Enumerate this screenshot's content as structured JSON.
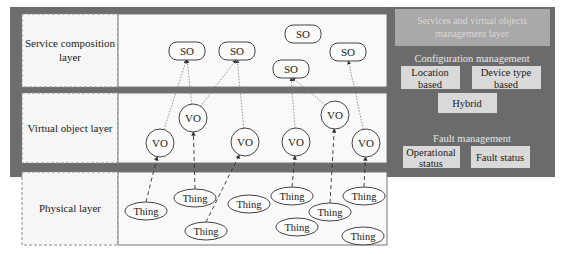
{
  "layers": [
    {
      "label_lines": [
        "Service composition",
        "layer"
      ]
    },
    {
      "label_lines": [
        "Virtual object layer"
      ]
    },
    {
      "label_lines": [
        "Physical layer"
      ]
    }
  ],
  "service_objects": [
    {
      "id": "so1",
      "label": "SO"
    },
    {
      "id": "so2",
      "label": "SO"
    },
    {
      "id": "so3",
      "label": "SO"
    },
    {
      "id": "so4",
      "label": "SO"
    },
    {
      "id": "so5",
      "label": "SO"
    }
  ],
  "virtual_objects": [
    {
      "id": "vo1",
      "label": "VO"
    },
    {
      "id": "vo2",
      "label": "VO"
    },
    {
      "id": "vo3",
      "label": "VO"
    },
    {
      "id": "vo4",
      "label": "VO"
    },
    {
      "id": "vo5",
      "label": "VO"
    },
    {
      "id": "vo6",
      "label": "VO"
    }
  ],
  "things": [
    {
      "id": "t1",
      "label": "Thing"
    },
    {
      "id": "t2",
      "label": "Thing"
    },
    {
      "id": "t3",
      "label": "Thing"
    },
    {
      "id": "t4",
      "label": "Thing"
    },
    {
      "id": "t5",
      "label": "Thing"
    },
    {
      "id": "t6",
      "label": "Thing"
    },
    {
      "id": "t7",
      "label": "Thing"
    },
    {
      "id": "t8",
      "label": "Thing"
    },
    {
      "id": "t9",
      "label": "Thing"
    }
  ],
  "vo_to_so_links": [
    [
      "vo1",
      "so1"
    ],
    [
      "vo2",
      "so1"
    ],
    [
      "vo2",
      "so2"
    ],
    [
      "vo3",
      "so2"
    ],
    [
      "vo4",
      "so4"
    ],
    [
      "vo5",
      "so4"
    ],
    [
      "vo6",
      "so5"
    ]
  ],
  "thing_to_vo_links": [
    [
      "t1",
      "vo1"
    ],
    [
      "t2",
      "vo2"
    ],
    [
      "t3",
      "vo3"
    ],
    [
      "t5",
      "vo4"
    ],
    [
      "t6",
      "vo5"
    ],
    [
      "t8",
      "vo6"
    ]
  ],
  "management_panel": {
    "title_lines": [
      "Services and virtual objects",
      "management layer"
    ],
    "configuration": {
      "title": "Configuration management",
      "location_lines": [
        "Location",
        "based"
      ],
      "device_type_lines": [
        "Device type",
        "based"
      ],
      "hybrid": "Hybrid"
    },
    "fault": {
      "title": "Fault management",
      "operational_lines": [
        "Operational",
        "status"
      ],
      "fault_status": "Fault status"
    }
  }
}
